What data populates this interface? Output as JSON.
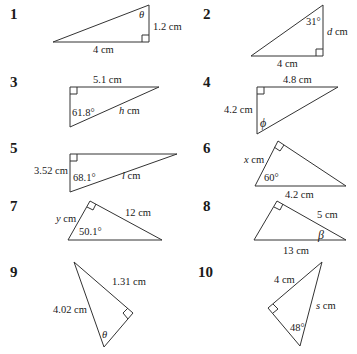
{
  "problems": [
    {
      "number": "1",
      "labels": {
        "angle": "θ",
        "side_vertical": "1.2 cm",
        "side_base": "4 cm"
      }
    },
    {
      "number": "2",
      "labels": {
        "angle": "31°",
        "side_vertical_var": "d",
        "side_vertical_unit": " cm",
        "side_base": "4 cm"
      }
    },
    {
      "number": "3",
      "labels": {
        "side_top": "5.1 cm",
        "angle": "61.8°",
        "hyp_var": "h",
        "hyp_unit": " cm"
      }
    },
    {
      "number": "4",
      "labels": {
        "side_top": "4.8 cm",
        "side_left": "4.2 cm",
        "angle": "ϕ"
      }
    },
    {
      "number": "5",
      "labels": {
        "side_left": "3.52 cm",
        "angle": "68.1°",
        "hyp_var": "l",
        "hyp_unit": " cm"
      }
    },
    {
      "number": "6",
      "labels": {
        "side_left_var": "x",
        "side_left_unit": " cm",
        "angle": "60°",
        "hyp": "4.2 cm"
      }
    },
    {
      "number": "7",
      "labels": {
        "side_left_var": "y",
        "side_left_unit": " cm",
        "side_right": "12 cm",
        "angle": "50.1°"
      }
    },
    {
      "number": "8",
      "labels": {
        "side_right": "5 cm",
        "angle": "β",
        "hyp": "13 cm"
      }
    },
    {
      "number": "9",
      "labels": {
        "side_right": "1.31 cm",
        "hyp": "4.02 cm",
        "angle": "θ"
      }
    },
    {
      "number": "10",
      "labels": {
        "side_left": "4 cm",
        "hyp_var": "s",
        "hyp_unit": " cm",
        "angle": "48°"
      }
    }
  ],
  "style": {
    "stroke": "#333333",
    "text": "#1a1a1a",
    "background": "#ffffff"
  }
}
